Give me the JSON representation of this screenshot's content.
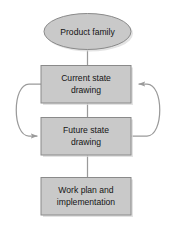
{
  "diagram": {
    "type": "flowchart",
    "colors": {
      "node_fill": "#c9c9c9",
      "node_stroke": "#8a8a8a",
      "shadow": "#d9d9d9",
      "connector": "#9a9a9a",
      "text": "#141414",
      "background": "#ffffff"
    },
    "nodes": [
      {
        "id": "product-family",
        "shape": "ellipse",
        "lines": [
          "Product family"
        ]
      },
      {
        "id": "current-state-drawing",
        "shape": "rectangle",
        "lines": [
          "Current state",
          "drawing"
        ]
      },
      {
        "id": "future-state-drawing",
        "shape": "rectangle",
        "lines": [
          "Future state",
          "drawing"
        ]
      },
      {
        "id": "work-plan-implementation",
        "shape": "rectangle",
        "lines": [
          "Work plan and",
          "implementation"
        ]
      }
    ],
    "connectors": [
      {
        "id": "product-family-to-current-state",
        "kind": "line",
        "from": "product-family",
        "to": "current-state-drawing",
        "arrow": false
      },
      {
        "id": "current-state-to-future-state",
        "kind": "line",
        "from": "current-state-drawing",
        "to": "future-state-drawing",
        "arrow": false
      },
      {
        "id": "future-state-to-work-plan",
        "kind": "line",
        "from": "future-state-drawing",
        "to": "work-plan-implementation",
        "arrow": false
      },
      {
        "id": "left-feedback-loop",
        "kind": "curve",
        "from": "current-state-drawing",
        "to": "future-state-drawing",
        "arrow": true,
        "side": "left"
      },
      {
        "id": "right-feedback-loop",
        "kind": "curve",
        "from": "future-state-drawing",
        "to": "current-state-drawing",
        "arrow": true,
        "side": "right"
      }
    ]
  }
}
